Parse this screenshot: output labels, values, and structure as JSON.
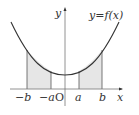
{
  "diagram": {
    "type": "function-graph",
    "function_label": "y=f(x)",
    "axis_labels": {
      "x": "x",
      "y": "y",
      "origin": "O"
    },
    "tick_labels": [
      "−b",
      "−a",
      "a",
      "b"
    ],
    "shaded_regions": [
      {
        "from": "−b",
        "to": "−a"
      },
      {
        "from": "a",
        "to": "b"
      }
    ],
    "colors": {
      "curve": "#333333",
      "axis": "#555555",
      "shade": "#e6e6e6",
      "guide": "#555555"
    }
  }
}
